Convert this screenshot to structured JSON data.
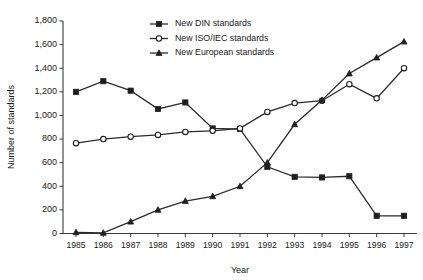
{
  "chart_data": {
    "type": "line",
    "title": "",
    "xlabel": "Year",
    "ylabel": "Number of standards",
    "categories": [
      "1985",
      "1986",
      "1987",
      "1988",
      "1989",
      "1990",
      "1991",
      "1992",
      "1993",
      "1994",
      "1995",
      "1996",
      "1997"
    ],
    "x": [
      1985,
      1986,
      1987,
      1988,
      1989,
      1990,
      1991,
      1992,
      1993,
      1994,
      1995,
      1996,
      1997
    ],
    "xlim": [
      1985,
      1997
    ],
    "ylim": [
      0,
      1800
    ],
    "yticks": [
      0,
      200,
      400,
      600,
      800,
      1000,
      1200,
      1400,
      1600,
      1800
    ],
    "ytick_labels": [
      "0",
      "200",
      "400",
      "600",
      "800",
      "1,000",
      "1,200",
      "1,400",
      "1,600",
      "1,800"
    ],
    "grid": false,
    "legend_position": "top-center",
    "series": [
      {
        "name": "New DIN standards",
        "marker": "filled-square",
        "values": [
          1200,
          1290,
          1210,
          1055,
          1110,
          890,
          885,
          565,
          480,
          475,
          485,
          150,
          150
        ]
      },
      {
        "name": "New ISO/IEC standards",
        "marker": "open-circle",
        "values": [
          765,
          800,
          820,
          835,
          860,
          870,
          890,
          1030,
          1105,
          1125,
          1265,
          1145,
          1400
        ]
      },
      {
        "name": "New European standards",
        "marker": "filled-triangle",
        "values": [
          10,
          5,
          100,
          200,
          275,
          315,
          400,
          600,
          925,
          1130,
          1355,
          1490,
          1625
        ]
      }
    ]
  },
  "colors": {
    "line": "#2b2b2b",
    "axis": "#3a3a3a",
    "text": "#1a1a1a",
    "background": "#ffffff"
  }
}
